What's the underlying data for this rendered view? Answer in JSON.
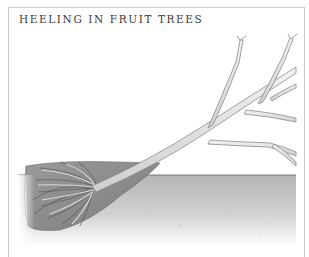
{
  "figure": {
    "title": "HEELING IN FRUIT TREES",
    "illustration": {
      "subject": "young fruit tree laid at an angle with roots buried in a trench",
      "elements": [
        "bare-root-ball",
        "trench",
        "trunk",
        "branches",
        "ground-soil"
      ]
    },
    "colors": {
      "border": "#c8c8c8",
      "title_text": "#3a3a3a",
      "soil_dark": "#8a8a8a",
      "ground": "#bdbdbd",
      "trunk": "#e6e6e6",
      "trunk_outline": "#8c8c8c"
    }
  }
}
